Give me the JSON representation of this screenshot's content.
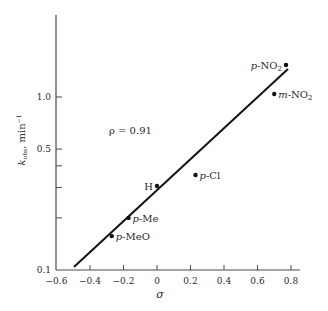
{
  "chart_data": {
    "type": "scatter",
    "title": "",
    "xlabel": "σ",
    "ylabel": "k_obs, min⁻¹",
    "ylabel_main": "k",
    "ylabel_sub": "obs",
    "ylabel_units": ", min",
    "ylabel_sup": "−1",
    "xscale": "linear",
    "yscale": "log",
    "xlim": [
      -0.6,
      0.85
    ],
    "ylim": [
      0.1,
      2.0
    ],
    "grid": false,
    "x_ticks": [
      {
        "value": -0.6,
        "label": "−0.6"
      },
      {
        "value": -0.4,
        "label": "−0.4"
      },
      {
        "value": -0.2,
        "label": "−0.2"
      },
      {
        "value": 0,
        "label": "0"
      },
      {
        "value": 0.2,
        "label": "0.2"
      },
      {
        "value": 0.4,
        "label": "0.4"
      },
      {
        "value": 0.6,
        "label": "0.6"
      },
      {
        "value": 0.8,
        "label": "0.8"
      }
    ],
    "y_ticks": [
      {
        "value": 0.1,
        "label": "0.1"
      },
      {
        "value": 0.2,
        "label": ""
      },
      {
        "value": 0.3,
        "label": ""
      },
      {
        "value": 0.4,
        "label": ""
      },
      {
        "value": 0.5,
        "label": "0.5"
      },
      {
        "value": 1.0,
        "label": "1.0"
      }
    ],
    "series": [
      {
        "name": "substituents",
        "points": [
          {
            "label": "p-MeO",
            "prefix": "p",
            "group": "-MeO",
            "sub": "",
            "x": -0.27,
            "y": 0.157,
            "label_side": "right"
          },
          {
            "label": "p-Me",
            "prefix": "p",
            "group": "-Me",
            "sub": "",
            "x": -0.17,
            "y": 0.2,
            "label_side": "right"
          },
          {
            "label": "H",
            "prefix": "",
            "group": "H",
            "sub": "",
            "x": 0.0,
            "y": 0.306,
            "label_side": "left"
          },
          {
            "label": "p-Cl",
            "prefix": "p",
            "group": "-Cl",
            "sub": "",
            "x": 0.23,
            "y": 0.354,
            "label_side": "right"
          },
          {
            "label": "m-NO2",
            "prefix": "m",
            "group": "-NO",
            "sub": "2",
            "x": 0.7,
            "y": 1.04,
            "label_side": "right"
          },
          {
            "label": "p-NO2",
            "prefix": "p",
            "group": "-NO",
            "sub": "2",
            "x": 0.77,
            "y": 1.53,
            "label_side": "left"
          }
        ]
      }
    ],
    "fit_line": {
      "x": [
        -0.496,
        0.782
      ],
      "y": [
        0.104,
        1.45
      ],
      "slope_rho": 0.91
    },
    "annotations": [
      {
        "text": "ρ = 0.91",
        "x": -0.29,
        "y": 0.6
      }
    ]
  },
  "annotation_text": "ρ = 0.91"
}
